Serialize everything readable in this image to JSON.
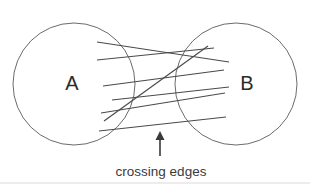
{
  "figure": {
    "background_color": "#ffffff",
    "width": 310,
    "height": 184
  },
  "sets": [
    {
      "id": "set-a",
      "label": "A",
      "cx": 74,
      "cy": 84,
      "r": 61,
      "stroke_color": "#6b6b6b",
      "label_x": 72,
      "label_y": 85
    },
    {
      "id": "set-b",
      "label": "B",
      "cx": 236,
      "cy": 84,
      "r": 61,
      "stroke_color": "#6b6b6b",
      "label_x": 247,
      "label_y": 85
    }
  ],
  "edges": {
    "count": 7,
    "stroke_color": "#4a4a4a",
    "convergence_point": {
      "x": 172,
      "y": 78
    },
    "segments": [
      {
        "id": "edge-1",
        "x1": 97,
        "y1": 42,
        "x2": 229,
        "y2": 62
      },
      {
        "id": "edge-2",
        "x1": 97,
        "y1": 60,
        "x2": 214,
        "y2": 48
      },
      {
        "id": "edge-3",
        "x1": 103,
        "y1": 86,
        "x2": 224,
        "y2": 70
      },
      {
        "id": "edge-4",
        "x1": 112,
        "y1": 100,
        "x2": 229,
        "y2": 87
      },
      {
        "id": "edge-5",
        "x1": 104,
        "y1": 121,
        "x2": 208,
        "y2": 46
      },
      {
        "id": "edge-6",
        "x1": 101,
        "y1": 113,
        "x2": 225,
        "y2": 93
      },
      {
        "id": "edge-7",
        "x1": 99,
        "y1": 131,
        "x2": 226,
        "y2": 117
      }
    ]
  },
  "annotation": {
    "caption": "crossing edges",
    "caption_x": 161,
    "caption_y": 176,
    "arrow": {
      "name": "up-arrow-icon",
      "x": 160,
      "tail_y": 156,
      "head_y": 131
    }
  },
  "frame": {
    "bottom_rule_color": "#d9d9d9",
    "bottom_rule_y": 183
  }
}
